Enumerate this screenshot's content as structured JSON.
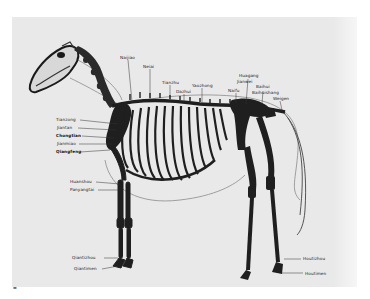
{
  "figure": {
    "background": "#e9e9e9",
    "ink": "#1a1a1a",
    "corner_mark": "▬"
  },
  "labels": {
    "top": [
      {
        "text": "Naijiao",
        "x": 120,
        "y": 55
      },
      {
        "text": "Neiai",
        "x": 143,
        "y": 64
      },
      {
        "text": "Tianzhu",
        "x": 162,
        "y": 80
      },
      {
        "text": "Dazhui",
        "x": 176,
        "y": 89
      },
      {
        "text": "Yaozhong",
        "x": 192,
        "y": 83
      },
      {
        "text": "Naifu",
        "x": 229,
        "y": 88
      },
      {
        "text": "Huagang",
        "x": 239,
        "y": 74
      },
      {
        "text": "Jianwei",
        "x": 237,
        "y": 80
      },
      {
        "text": "Baihui",
        "x": 256,
        "y": 86
      },
      {
        "text": "Weigen",
        "x": 272,
        "y": 96
      },
      {
        "text": "Baihuishang",
        "x": 254,
        "y": 91
      }
    ],
    "left": [
      {
        "text": "Tianzong",
        "x": 56,
        "y": 117,
        "bold": false
      },
      {
        "text": "Jiantan",
        "x": 57,
        "y": 125,
        "bold": false
      },
      {
        "text": "Chongtian",
        "x": 56,
        "y": 133,
        "bold": true
      },
      {
        "text": "Jianmiao",
        "x": 57,
        "y": 141,
        "bold": false
      },
      {
        "text": "Qiangfeng",
        "x": 56,
        "y": 149,
        "bold": true
      },
      {
        "text": "Huanshou",
        "x": 70,
        "y": 179,
        "bold": false
      },
      {
        "text": "Panyangtai",
        "x": 70,
        "y": 187,
        "bold": false
      },
      {
        "text": "Qiantizhou",
        "x": 72,
        "y": 255,
        "bold": false
      },
      {
        "text": "Qiantimen",
        "x": 74,
        "y": 266,
        "bold": false
      }
    ],
    "right": [
      {
        "text": "Houtizhou",
        "x": 303,
        "y": 256,
        "bold": false
      },
      {
        "text": "Houtimen",
        "x": 305,
        "y": 271,
        "bold": false
      }
    ]
  }
}
